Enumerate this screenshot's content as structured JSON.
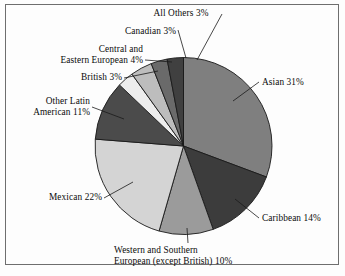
{
  "chart_data": {
    "type": "pie",
    "title": "",
    "subtitle": "",
    "xlabel": "",
    "ylabel": "",
    "legend_position": "none",
    "grid": false,
    "units": "percent",
    "start_angle_deg": 0,
    "direction": "clockwise",
    "categories": [
      "Asian",
      "Caribbean",
      "Western and Southern European (except British)",
      "Mexican",
      "Other Latin American",
      "British",
      "Central and Eastern European",
      "Canadian",
      "All Others"
    ],
    "values": [
      31,
      14,
      10,
      22,
      11,
      3,
      4,
      3,
      3
    ],
    "slices": [
      {
        "name": "Asian",
        "value": 31,
        "label": "Asian 31%",
        "label_lines": [
          "Asian 31%"
        ],
        "color": "#7f7f7f"
      },
      {
        "name": "Caribbean",
        "value": 14,
        "label": "Caribbean 14%",
        "label_lines": [
          "Caribbean 14%"
        ],
        "color": "#3c3c3c"
      },
      {
        "name": "Western and Southern European (except British)",
        "value": 10,
        "label": "Western and Southern European (except British) 10%",
        "label_lines": [
          "Western and Southern",
          "European (except British) 10%"
        ],
        "color": "#9b9b9b"
      },
      {
        "name": "Mexican",
        "value": 22,
        "label": "Mexican 22%",
        "label_lines": [
          "Mexican 22%"
        ],
        "color": "#d4d4d4"
      },
      {
        "name": "Other Latin American",
        "value": 11,
        "label": "Other Latin American 11%",
        "label_lines": [
          "Other Latin",
          "American 11%"
        ],
        "color": "#4b4b4b"
      },
      {
        "name": "British",
        "value": 3,
        "label": "British 3%",
        "label_lines": [
          "British 3%"
        ],
        "color": "#ededed"
      },
      {
        "name": "Central and Eastern European",
        "value": 4,
        "label": "Central and Eastern European 4%",
        "label_lines": [
          "Central and",
          "Eastern European 4%"
        ],
        "color": "#bdbdbd"
      },
      {
        "name": "Canadian",
        "value": 3,
        "label": "Canadian 3%",
        "label_lines": [
          "Canadian 3%"
        ],
        "color": "#6a6a6a"
      },
      {
        "name": "All Others",
        "value": 3,
        "label": "All Others 3%",
        "label_lines": [
          "All Others 3%"
        ],
        "color": "#404040"
      }
    ]
  },
  "labels": {
    "all_others": "All Others 3%",
    "canadian": "Canadian 3%",
    "central_eastern_european_l1": "Central and",
    "central_eastern_european_l2": "Eastern European 4%",
    "british": "British 3%",
    "other_latin_american_l1": "Other Latin",
    "other_latin_american_l2": "American 11%",
    "mexican": "Mexican 22%",
    "western_southern_european_l1": "Western and Southern",
    "western_southern_european_l2": "European (except British) 10%",
    "caribbean": "Caribbean 14%",
    "asian": "Asian 31%"
  },
  "style": {
    "outline_color": "#1a1a1a",
    "frame_color": "#6e6e6e",
    "background": "#fdfdfd",
    "text_color": "#0b0b0b"
  }
}
